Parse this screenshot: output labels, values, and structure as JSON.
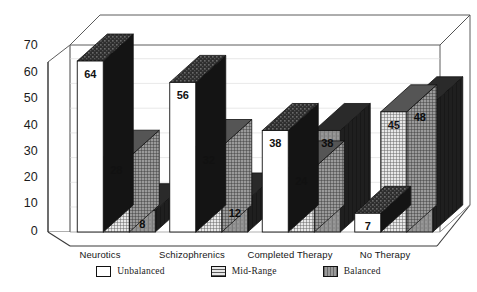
{
  "chart_data": {
    "type": "bar",
    "title": "",
    "subtitle": "",
    "xlabel": "",
    "ylabel": "",
    "ylim": [
      0,
      70
    ],
    "ytick_step": 10,
    "yticks": [
      "0",
      "10",
      "20",
      "30",
      "40",
      "50",
      "60",
      "70"
    ],
    "grid": false,
    "three_d": true,
    "legend_position": "bottom",
    "categories": [
      "Neurotics",
      "Schizophrenics",
      "Completed Therapy",
      "No Therapy"
    ],
    "series": [
      {
        "name": "Unbalanced",
        "values": [
          64,
          56,
          38,
          7
        ],
        "pattern": "solid-white",
        "fill": "#ffffff"
      },
      {
        "name": "Mid-Range",
        "values": [
          28,
          32,
          24,
          45
        ],
        "pattern": "fine-grid",
        "fill": "#d9d9d9"
      },
      {
        "name": "Balanced",
        "values": [
          8,
          12,
          38,
          48
        ],
        "pattern": "dark-noise",
        "fill": "#8a8a8a"
      }
    ],
    "value_labels": [
      {
        "category": "Neurotics",
        "series": "Unbalanced",
        "text": "64"
      },
      {
        "category": "Neurotics",
        "series": "Mid-Range",
        "text": "28"
      },
      {
        "category": "Neurotics",
        "series": "Balanced",
        "text": "8"
      },
      {
        "category": "Schizophrenics",
        "series": "Unbalanced",
        "text": "56"
      },
      {
        "category": "Schizophrenics",
        "series": "Mid-Range",
        "text": "32"
      },
      {
        "category": "Schizophrenics",
        "series": "Balanced",
        "text": "12"
      },
      {
        "category": "Completed Therapy",
        "series": "Unbalanced",
        "text": "38"
      },
      {
        "category": "Completed Therapy",
        "series": "Mid-Range",
        "text": "24"
      },
      {
        "category": "Completed Therapy",
        "series": "Balanced",
        "text": "38"
      },
      {
        "category": "No Therapy",
        "series": "Unbalanced",
        "text": "7"
      },
      {
        "category": "No Therapy",
        "series": "Mid-Range",
        "text": "45"
      },
      {
        "category": "No Therapy",
        "series": "Balanced",
        "text": "48"
      }
    ]
  },
  "legend": {
    "items": [
      {
        "label": "Unbalanced",
        "color": "#ffffff"
      },
      {
        "label": "Mid-Range",
        "color": "#d9d9d9"
      },
      {
        "label": "Balanced",
        "color": "#8a8a8a"
      }
    ]
  },
  "axes": {
    "y": {
      "ticks": [
        "70",
        "60",
        "50",
        "40",
        "30",
        "20",
        "10",
        "0"
      ]
    },
    "x": {
      "ticks": [
        "Neurotics",
        "Schizophrenics",
        "Completed Therapy",
        "No Therapy"
      ]
    }
  },
  "colors": {
    "axis": "#2a2a2a",
    "bar_side": "#1a1a1a",
    "bar_top": "#3a3a3a",
    "plot_background": "#ffffff"
  }
}
